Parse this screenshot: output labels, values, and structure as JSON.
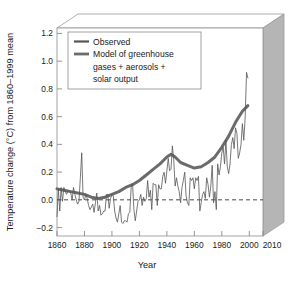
{
  "chart_data": {
    "type": "line",
    "title": "",
    "xlabel": "Year",
    "ylabel": "Temperature change (°C) from 1860–1999 mean",
    "xlim": [
      1860,
      2010
    ],
    "ylim": [
      -0.3,
      1.2
    ],
    "xticks": [
      1860,
      1880,
      1900,
      1920,
      1940,
      1960,
      1980,
      2000,
      2010
    ],
    "xticklabels": [
      "1860",
      "1880",
      "1900",
      "1920",
      "1940",
      "1960",
      "1980",
      "2000",
      "2010"
    ],
    "yticks": [
      -0.2,
      0.0,
      0.2,
      0.4,
      0.6,
      0.8,
      1.0,
      1.2
    ],
    "yticklabels": [
      "−0.2",
      "0.0",
      "0.2",
      "0.4",
      "0.6",
      "0.8",
      "1.0",
      "1.2"
    ],
    "grid": false,
    "legend_position": "upper-left",
    "annotations": [
      {
        "type": "hline",
        "y": 0.0,
        "style": "dashed",
        "label": "zero reference line"
      }
    ],
    "series": [
      {
        "name": "Observed",
        "color": "#555555",
        "linewidth": 0.8,
        "x": [
          1860,
          1861,
          1862,
          1863,
          1864,
          1865,
          1866,
          1867,
          1868,
          1869,
          1870,
          1871,
          1872,
          1873,
          1874,
          1875,
          1876,
          1877,
          1878,
          1879,
          1880,
          1881,
          1882,
          1883,
          1884,
          1885,
          1886,
          1887,
          1888,
          1889,
          1890,
          1891,
          1892,
          1893,
          1894,
          1895,
          1896,
          1897,
          1898,
          1899,
          1900,
          1901,
          1902,
          1903,
          1904,
          1905,
          1906,
          1907,
          1908,
          1909,
          1910,
          1911,
          1912,
          1913,
          1914,
          1915,
          1916,
          1917,
          1918,
          1919,
          1920,
          1921,
          1922,
          1923,
          1924,
          1925,
          1926,
          1927,
          1928,
          1929,
          1930,
          1931,
          1932,
          1933,
          1934,
          1935,
          1936,
          1937,
          1938,
          1939,
          1940,
          1941,
          1942,
          1943,
          1944,
          1945,
          1946,
          1947,
          1948,
          1949,
          1950,
          1951,
          1952,
          1953,
          1954,
          1955,
          1956,
          1957,
          1958,
          1959,
          1960,
          1961,
          1962,
          1963,
          1964,
          1965,
          1966,
          1967,
          1968,
          1969,
          1970,
          1971,
          1972,
          1973,
          1974,
          1975,
          1976,
          1977,
          1978,
          1979,
          1980,
          1981,
          1982,
          1983,
          1984,
          1985,
          1986,
          1987,
          1988,
          1989,
          1990,
          1991,
          1992,
          1993,
          1994,
          1995,
          1996,
          1997,
          1998,
          1999
        ],
        "values": [
          -0.16,
          0.04,
          -0.12,
          0.05,
          -0.05,
          0.05,
          0.02,
          0.0,
          0.03,
          0.02,
          0.01,
          -0.04,
          0.05,
          0.0,
          -0.04,
          -0.07,
          -0.05,
          0.12,
          0.3,
          -0.02,
          -0.04,
          0.0,
          -0.03,
          -0.08,
          -0.11,
          -0.09,
          -0.07,
          -0.13,
          -0.06,
          0.01,
          -0.12,
          -0.08,
          -0.15,
          -0.14,
          -0.12,
          -0.12,
          0.0,
          0.0,
          -0.1,
          -0.03,
          0.0,
          -0.01,
          -0.12,
          -0.17,
          -0.2,
          -0.14,
          -0.08,
          -0.2,
          -0.21,
          -0.19,
          -0.19,
          -0.2,
          -0.14,
          -0.13,
          0.05,
          0.08,
          -0.11,
          -0.19,
          -0.12,
          -0.05,
          -0.04,
          0.0,
          -0.08,
          -0.02,
          -0.05,
          -0.03,
          0.1,
          -0.02,
          0.03,
          -0.11,
          0.08,
          0.07,
          0.07,
          -0.08,
          0.07,
          0.04,
          0.04,
          0.13,
          0.16,
          0.08,
          0.17,
          0.26,
          0.17,
          0.18,
          0.35,
          0.25,
          0.06,
          0.12,
          0.06,
          0.02,
          -0.06,
          0.05,
          0.1,
          0.16,
          -0.01,
          -0.06,
          -0.08,
          0.12,
          0.1,
          0.12,
          0.04,
          0.12,
          0.1,
          0.13,
          -0.12,
          -0.06,
          0.0,
          0.02,
          -0.03,
          0.12,
          0.07,
          -0.02,
          0.06,
          0.21,
          -0.06,
          0.02,
          -0.11,
          0.22,
          0.14,
          0.2,
          0.3,
          0.34,
          0.22,
          0.39,
          0.2,
          0.15,
          0.22,
          0.36,
          0.41,
          0.33,
          0.48,
          0.44,
          0.26,
          0.3,
          0.36,
          0.51,
          0.39,
          0.55,
          0.88,
          0.84
        ]
      },
      {
        "name": "Model of greenhouse gases + aerosols + solar output",
        "color": "#6b6b6b",
        "linewidth": 3.0,
        "x": [
          1860,
          1865,
          1870,
          1875,
          1880,
          1885,
          1890,
          1895,
          1900,
          1905,
          1910,
          1915,
          1920,
          1925,
          1930,
          1935,
          1940,
          1943,
          1946,
          1950,
          1955,
          1960,
          1965,
          1970,
          1975,
          1980,
          1985,
          1990,
          1995,
          1999
        ],
        "values": [
          0.04,
          0.03,
          0.02,
          0.01,
          0.0,
          -0.02,
          -0.03,
          -0.02,
          0.0,
          0.02,
          0.05,
          0.07,
          0.1,
          0.14,
          0.18,
          0.22,
          0.27,
          0.29,
          0.27,
          0.23,
          0.21,
          0.19,
          0.2,
          0.23,
          0.27,
          0.34,
          0.42,
          0.52,
          0.6,
          0.64
        ]
      }
    ]
  },
  "legend": {
    "entries": [
      {
        "label": "Observed",
        "swatch": "line-swatch-observed"
      },
      {
        "label": "Model of greenhouse",
        "swatch": "line-swatch-model"
      },
      {
        "label": "gases + aerosols +",
        "swatch": ""
      },
      {
        "label": "solar output",
        "swatch": ""
      }
    ]
  },
  "colors": {
    "observed_line": "#555555",
    "model_line": "#6b6b6b",
    "axis": "#8a8a8a",
    "panel_side": "#b5b5b5",
    "panel_top": "#ffffff",
    "text": "#1a1a1a",
    "background": "#ffffff"
  }
}
